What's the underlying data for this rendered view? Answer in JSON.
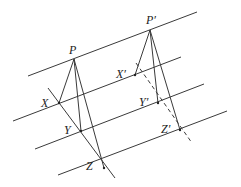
{
  "diagram": {
    "title": "",
    "parallel_lines": [
      {
        "id": "l1",
        "x1": 28,
        "y1": 76,
        "x2": 197,
        "y2": 12
      },
      {
        "id": "l2",
        "x1": 13,
        "y1": 121,
        "x2": 181,
        "y2": 57
      },
      {
        "id": "l3",
        "x1": 35,
        "y1": 149,
        "x2": 204,
        "y2": 84
      },
      {
        "id": "l4",
        "x1": 58,
        "y1": 175,
        "x2": 227,
        "y2": 111
      }
    ],
    "left_figure": {
      "labels": {
        "P": "P",
        "X": "X",
        "Y": "Y",
        "Z": "Z"
      },
      "points": {
        "P": [
          74,
          59
        ],
        "X": [
          59,
          103
        ],
        "Y": [
          81,
          131
        ],
        "Z": [
          104,
          168
        ]
      },
      "transversal": {
        "x1": 48,
        "y1": 88,
        "x2": 115,
        "y2": 178,
        "style": "solid"
      }
    },
    "right_figure": {
      "labels": {
        "P": "P′",
        "X": "X′",
        "Y": "Y′",
        "Z": "Z′"
      },
      "points": {
        "P": [
          150,
          30
        ],
        "X": [
          135,
          75
        ],
        "Y": [
          158,
          103
        ],
        "Z": [
          180,
          130
        ]
      },
      "transversal": {
        "x1": 136,
        "y1": 63,
        "x2": 192,
        "y2": 143,
        "style": "dashed"
      }
    }
  }
}
